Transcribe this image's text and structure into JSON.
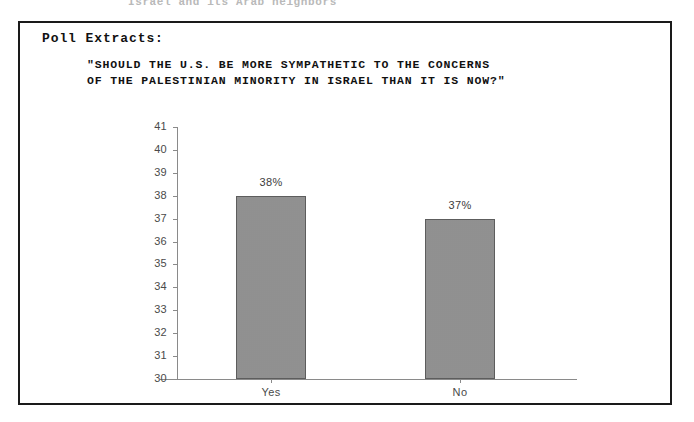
{
  "page": {
    "top_fragment": "Israel and its Arab neighbors"
  },
  "panel": {
    "heading": "Poll Extracts:",
    "question_line1": "\"SHOULD THE U.S. BE MORE SYMPATHETIC TO THE CONCERNS",
    "question_line2": "OF THE PALESTINIAN MINORITY IN ISRAEL THAN IT IS NOW?\""
  },
  "chart_data": {
    "type": "bar",
    "title": "\"SHOULD THE U.S. BE MORE SYMPATHETIC TO THE CONCERNS OF THE PALESTINIAN MINORITY IN ISRAEL THAN IT IS NOW?\"",
    "xlabel": "",
    "ylabel": "",
    "categories": [
      "Yes",
      "No"
    ],
    "values": [
      38,
      37
    ],
    "data_labels": [
      "38%",
      "37%"
    ],
    "ylim": [
      30,
      41
    ],
    "yticks": [
      41,
      40,
      39,
      38,
      37,
      36,
      35,
      34,
      33,
      32,
      31,
      30
    ],
    "ytick_labels": [
      "41",
      "40",
      "39",
      "38",
      "37",
      "36",
      "35",
      "34",
      "33",
      "32",
      "31",
      "30"
    ],
    "grid": false,
    "legend": "none",
    "bar_fill": "#d2d2d2",
    "bar_edge": "#5d5d5d",
    "axis_color": "#8a8a8a"
  }
}
